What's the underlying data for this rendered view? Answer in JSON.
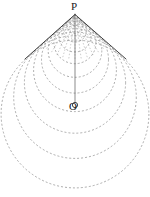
{
  "figure": {
    "background_color": "#ffffff",
    "width": 150,
    "height": 197,
    "labels": [
      {
        "id": "P",
        "text": "P",
        "x": 75,
        "y": 6,
        "role": "apex-point-label"
      },
      {
        "id": "O",
        "text": "O",
        "x": 73,
        "y": 107,
        "role": "center-point-label"
      }
    ],
    "points": {
      "P": {
        "x": 75,
        "y": 14.5,
        "name": "apex-vertex"
      },
      "O": {
        "x": 75,
        "y": 105,
        "name": "circle-center"
      }
    },
    "axis_line": {
      "name": "axis-of-symmetry",
      "x1": 75,
      "y1": 14.5,
      "x2": 75,
      "y2": 110,
      "color": "#5a5a5a",
      "stroke_width": 0.7,
      "style": "solid"
    },
    "tangent_lines": [
      {
        "name": "left-tangent-line",
        "x1": 75,
        "y1": 14.5,
        "x2": 25,
        "y2": 59,
        "color": "#2b2b2b",
        "stroke_width": 0.9,
        "style": "solid"
      },
      {
        "name": "right-tangent-line",
        "x1": 75,
        "y1": 14.5,
        "x2": 126,
        "y2": 59,
        "color": "#2b2b2b",
        "stroke_width": 0.9,
        "style": "solid"
      }
    ],
    "circle_family": {
      "name": "nested-tangent-circles",
      "color": "#8a8a8a",
      "stroke_width": 0.7,
      "dash_pattern": "2,2",
      "apex_x": 75,
      "apex_y": 14.5,
      "half_angle_deg": 48,
      "circles": [
        {
          "index": 1,
          "cx": 75,
          "cy": 21.0,
          "r": 4.8
        },
        {
          "index": 2,
          "cx": 75,
          "cy": 25.4,
          "r": 8.1
        },
        {
          "index": 3,
          "cx": 75,
          "cy": 30.3,
          "r": 11.7
        },
        {
          "index": 4,
          "cx": 75,
          "cy": 36.0,
          "r": 16.0
        },
        {
          "index": 5,
          "cx": 75,
          "cy": 42.7,
          "r": 21.0
        },
        {
          "index": 6,
          "cx": 75,
          "cy": 50.5,
          "r": 26.8
        },
        {
          "index": 7,
          "cx": 75,
          "cy": 59.6,
          "r": 33.5
        },
        {
          "index": 8,
          "cx": 75,
          "cy": 70.2,
          "r": 41.4
        },
        {
          "index": 9,
          "cx": 75,
          "cy": 82.6,
          "r": 50.6
        },
        {
          "index": 10,
          "cx": 75,
          "cy": 97.1,
          "r": 61.3
        },
        {
          "index": 11,
          "cx": 75,
          "cy": 114.0,
          "r": 73.9
        }
      ]
    },
    "radial_rays": {
      "name": "apex-convergence-rays",
      "color": "#9a9a9a",
      "stroke_width": 0.5,
      "dash_pattern": "1.5,1.8",
      "count": 13,
      "spread_deg": 48,
      "length": 46
    }
  }
}
